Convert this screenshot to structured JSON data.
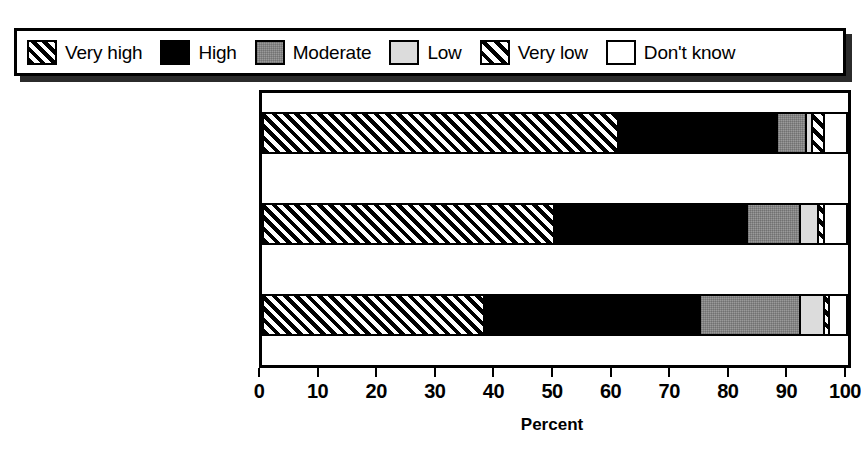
{
  "legend": {
    "items": [
      {
        "label": "Very high",
        "swatch": "veryhigh-swatch-icon",
        "fill": "fill-veryhigh"
      },
      {
        "label": "High",
        "swatch": "high-swatch-icon",
        "fill": "fill-high"
      },
      {
        "label": "Moderate",
        "swatch": "moderate-swatch-icon",
        "fill": "fill-moderate"
      },
      {
        "label": "Low",
        "swatch": "low-swatch-icon",
        "fill": "fill-low"
      },
      {
        "label": "Very low",
        "swatch": "verylow-swatch-icon",
        "fill": "fill-verylow"
      },
      {
        "label": "Don't know",
        "swatch": "dontknow-swatch-icon",
        "fill": "fill-dontknow"
      }
    ]
  },
  "chart_data": {
    "type": "bar",
    "orientation": "horizontal",
    "stacked": true,
    "normalized_to_percent": true,
    "title": "",
    "subtitle": "",
    "xlabel": "Percent",
    "ylabel": "",
    "xlim": [
      0,
      100
    ],
    "xticks": [
      0,
      10,
      20,
      30,
      40,
      50,
      60,
      70,
      80,
      90,
      100
    ],
    "xtick_labels": [
      "0",
      "10",
      "20",
      "30",
      "40",
      "50",
      "60",
      "70",
      "80",
      "90",
      "100"
    ],
    "grid": false,
    "legend_position": "top",
    "categories": [
      "Minimizing U.S. casualties",
      "Overthrowing the Iraqi regime quickly",
      "Minimizing Iraqi civilian casualties"
    ],
    "category_lines": [
      [
        "Minimizing U.S.",
        "casualties"
      ],
      [
        "Overthrowing the Iraqi",
        "regime quickly"
      ],
      [
        "Minimizing Iraqi civilian",
        "casualties"
      ]
    ],
    "series": [
      {
        "name": "Very high",
        "values": [
          61,
          50,
          38
        ]
      },
      {
        "name": "High",
        "values": [
          27,
          33,
          37
        ]
      },
      {
        "name": "Moderate",
        "values": [
          5,
          9,
          17
        ]
      },
      {
        "name": "Low",
        "values": [
          1,
          3,
          4
        ]
      },
      {
        "name": "Very low",
        "values": [
          2,
          1,
          1
        ]
      },
      {
        "name": "Don't know",
        "values": [
          4,
          4,
          3
        ]
      }
    ]
  }
}
